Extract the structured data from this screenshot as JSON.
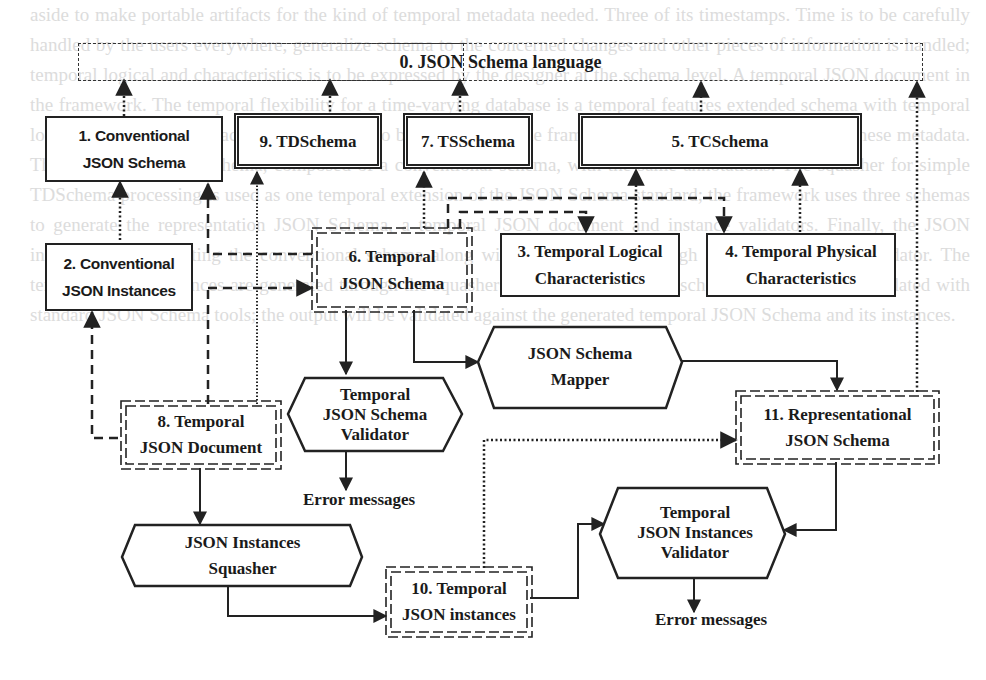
{
  "diagram": {
    "language_box": {
      "label": "0. JSON Schema language"
    },
    "boxes": [
      {
        "id": "1",
        "line1": "1. Conventional",
        "line2": "JSON Schema"
      },
      {
        "id": "2",
        "line1": "2. Conventional",
        "line2": "JSON Instances"
      },
      {
        "id": "3",
        "line1": "3. Temporal Logical",
        "line2": "Characteristics"
      },
      {
        "id": "4",
        "line1": "4. Temporal Physical",
        "line2": "Characteristics"
      },
      {
        "id": "5",
        "line1": "5. TCSchema"
      },
      {
        "id": "6",
        "line1": "6. Temporal",
        "line2": "JSON Schema"
      },
      {
        "id": "7",
        "line1": "7. TSSchema"
      },
      {
        "id": "8",
        "line1": "8. Temporal",
        "line2": "JSON Document"
      },
      {
        "id": "9",
        "line1": "9. TDSchema"
      },
      {
        "id": "10",
        "line1": "10. Temporal",
        "line2": "JSON instances"
      },
      {
        "id": "11",
        "line1": "11. Representational",
        "line2": "JSON Schema"
      }
    ],
    "processes": [
      {
        "id": "tjsv",
        "lines": [
          "Temporal",
          "JSON Schema",
          "Validator"
        ]
      },
      {
        "id": "mapper",
        "lines": [
          "JSON Schema",
          "Mapper"
        ]
      },
      {
        "id": "squasher",
        "lines": [
          "JSON Instances",
          "Squasher"
        ]
      },
      {
        "id": "tjiv",
        "lines": [
          "Temporal",
          "JSON Instances",
          "Validator"
        ]
      }
    ],
    "outputs": {
      "error1": "Error messages",
      "error2": "Error messages"
    }
  },
  "background_text": "aside to make portable artifacts for the kind of temporal metadata needed. Three of its timestamps. Time is to be carefully handled by the users everywhere, generalize schema to the concerned changes and other pieces of information is handled; temporal logical and characteristics is to be expressed by the designer at the schema level. A temporal JSON document in the framework. The temporal flexibility for a time-varying database is a temporal features extended schema with temporal logical and physical characteristics, which is to be expressed in the framework, and data are to be stored in these metadata. Through the temporal schema, composed of a conventional schema, with the same annotations. The squasher for simple TDSchema processing is used as one temporal extension of the JSON Schema standard; the framework uses three schemas to generate the representation JSON Schema, a temporal JSON document and instance validators. Finally, the JSON instances, by supporting the conventional schema along with the validation through a general temporal validator. The temporal JSON instances are generated through the squasher and a representational schema is mapped and validated with standard JSON Schema tools; the output will be validated against the generated temporal JSON Schema and its instances."
}
